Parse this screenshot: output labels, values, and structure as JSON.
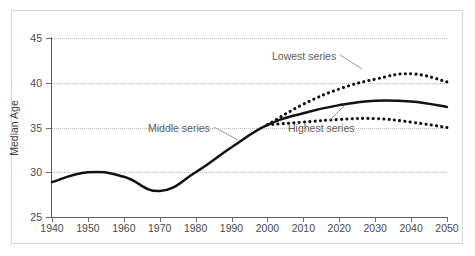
{
  "figure": {
    "ghost_top_text": "",
    "y_axis_title": "Median Age"
  },
  "annotations": {
    "lowest": "Lowest series",
    "middle": "Middle series",
    "highest": "Highest series"
  },
  "chart_data": {
    "type": "line",
    "title": "",
    "xlabel": "",
    "ylabel": "Median Age",
    "xlim": [
      1940,
      2050
    ],
    "ylim": [
      25,
      45
    ],
    "yticks": [
      25,
      30,
      35,
      40,
      45
    ],
    "xticks": [
      1940,
      1950,
      1960,
      1970,
      1980,
      1990,
      2000,
      2010,
      2020,
      2030,
      2040,
      2050
    ],
    "grid": "horizontal-dotted",
    "legend": "inline-annotations",
    "x": [
      1940,
      1950,
      1960,
      1970,
      1980,
      1990,
      2000,
      2010,
      2020,
      2030,
      2040,
      2050
    ],
    "series": [
      {
        "name": "Lowest series",
        "style": "dotted",
        "color": "#111111",
        "values": [
          28.9,
          30.0,
          29.5,
          27.9,
          30.0,
          32.8,
          35.3,
          37.6,
          39.3,
          40.4,
          41.0,
          40.1
        ]
      },
      {
        "name": "Middle series",
        "style": "solid",
        "color": "#111111",
        "values": [
          28.9,
          30.0,
          29.5,
          27.9,
          30.0,
          32.8,
          35.3,
          36.6,
          37.5,
          38.0,
          37.9,
          37.3
        ]
      },
      {
        "name": "Highest series",
        "style": "dotted",
        "color": "#111111",
        "values": [
          28.9,
          30.0,
          29.5,
          27.9,
          30.0,
          32.8,
          35.3,
          35.6,
          35.9,
          36.0,
          35.6,
          35.0
        ]
      }
    ]
  }
}
